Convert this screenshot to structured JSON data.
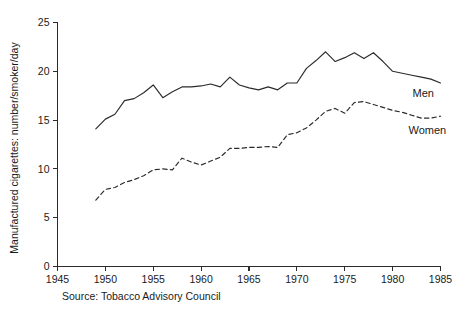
{
  "chart_data": {
    "type": "line",
    "title": "",
    "subtitle": "",
    "xlabel": "",
    "ylabel": "Manufactured cigarettes: number/smoker/day",
    "xlim": [
      1945,
      1985
    ],
    "ylim": [
      0,
      25
    ],
    "xticks": [
      1945,
      1950,
      1955,
      1960,
      1965,
      1970,
      1975,
      1980,
      1985
    ],
    "yticks": [
      0,
      5,
      10,
      15,
      20,
      25
    ],
    "xtick_labels": [
      "1945",
      "1950",
      "1955",
      "1960",
      "1965",
      "1970",
      "1975",
      "1980",
      "1985"
    ],
    "ytick_labels": [
      "0",
      "5",
      "10",
      "15",
      "20",
      "25"
    ],
    "grid": false,
    "legend_position": "inline-right-end-of-line",
    "source_note": "Source: Tobacco Advisory Council",
    "x": [
      1949,
      1950,
      1951,
      1952,
      1953,
      1954,
      1955,
      1956,
      1957,
      1958,
      1959,
      1960,
      1961,
      1962,
      1963,
      1964,
      1965,
      1966,
      1967,
      1968,
      1969,
      1970,
      1971,
      1972,
      1973,
      1974,
      1975,
      1976,
      1977,
      1978,
      1979,
      1980,
      1981,
      1982,
      1983,
      1984,
      1985
    ],
    "series": [
      {
        "name": "Men",
        "label": "Men",
        "style": "solid",
        "color": "#2b2b2b",
        "values": [
          14.1,
          15.1,
          15.6,
          17.0,
          17.2,
          17.8,
          18.6,
          17.3,
          17.9,
          18.4,
          18.4,
          18.5,
          18.7,
          18.4,
          19.4,
          18.6,
          18.3,
          18.1,
          18.4,
          18.1,
          18.8,
          18.8,
          20.3,
          21.1,
          22.0,
          21.0,
          21.4,
          21.9,
          21.3,
          21.9,
          21.0,
          20.0,
          19.8,
          19.6,
          19.4,
          19.2,
          18.8
        ]
      },
      {
        "name": "Women",
        "label": "Women",
        "style": "dashed",
        "color": "#2b2b2b",
        "values": [
          6.8,
          7.9,
          8.1,
          8.6,
          8.9,
          9.3,
          9.9,
          10.0,
          9.9,
          11.1,
          10.7,
          10.4,
          10.8,
          11.2,
          12.1,
          12.1,
          12.2,
          12.2,
          12.3,
          12.2,
          13.5,
          13.7,
          14.2,
          15.0,
          15.9,
          16.2,
          15.7,
          16.8,
          16.9,
          16.6,
          16.3,
          16.0,
          15.8,
          15.5,
          15.2,
          15.2,
          15.4
        ]
      }
    ]
  }
}
